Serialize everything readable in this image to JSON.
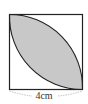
{
  "figure": {
    "type": "geometry",
    "square": {
      "side_label": "4cm"
    },
    "colors": {
      "shade": "#c8c8c8",
      "stroke": "#222222",
      "background": "#ffffff"
    }
  }
}
